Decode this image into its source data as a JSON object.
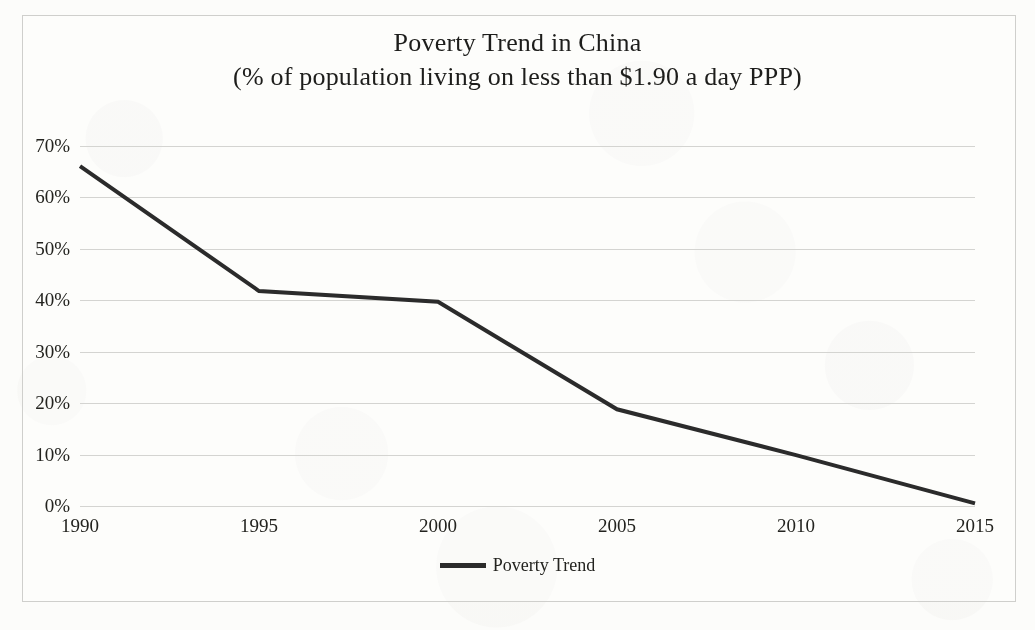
{
  "figure": {
    "background_color": "#fcfcfa",
    "frame_border_color": "#cfcfcc",
    "title_line1": "Poverty Trend in China",
    "title_line2": "(% of population living on less than $1.90 a day PPP)"
  },
  "legend": {
    "position": "bottom-center",
    "entries": [
      {
        "label": "Poverty Trend",
        "color": "#2b2b2b",
        "marker": "line-swatch"
      }
    ]
  },
  "axes": {
    "y_tick_labels": [
      "70%",
      "60%",
      "50%",
      "40%",
      "30%",
      "20%",
      "10%",
      "0%"
    ],
    "x_tick_labels": [
      "1990",
      "1995",
      "2000",
      "2005",
      "2010",
      "2015"
    ],
    "grid": true,
    "y_label": "",
    "x_label": ""
  },
  "chart_data": {
    "type": "line",
    "title": "Poverty Trend in China (% of population living on less than $1.90 a day PPP)",
    "subtitle": "(% of population living on less than $1.90 a day PPP)",
    "xlabel": "",
    "ylabel": "% of population",
    "x": [
      1990,
      1995,
      2000,
      2005,
      2010,
      2015
    ],
    "xtick_labels": [
      "1990",
      "1995",
      "2000",
      "2005",
      "2010",
      "2015"
    ],
    "ytick_labels": [
      "0%",
      "10%",
      "20%",
      "30%",
      "40%",
      "50%",
      "60%",
      "70%"
    ],
    "ylim": [
      0,
      70
    ],
    "xlim": [
      1990,
      2015
    ],
    "grid": true,
    "legend_position": "bottom-center",
    "series": [
      {
        "name": "Poverty Trend",
        "color": "#2b2b2b",
        "line_width": 4,
        "values": [
          66.1,
          41.8,
          39.7,
          18.8,
          9.9,
          0.5
        ],
        "value_labels": [
          "66.1%",
          "41.8%",
          "39.7%",
          "18.8%",
          "9.9%",
          "0.5%"
        ]
      }
    ]
  }
}
